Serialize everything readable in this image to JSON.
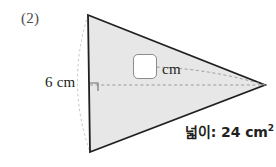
{
  "problem": {
    "item_number": "(2)",
    "height_label": "6 cm",
    "unit_label": "cm",
    "area_prefix": "넓이: 24 cm",
    "area_exponent": "2",
    "answer_value": ""
  },
  "figure": {
    "shape": "triangle",
    "fill_color": "#e7e7e7",
    "stroke_color": "#231f20",
    "guide_color": "#b9b9b9",
    "vertices": {
      "top": [
        88,
        15
      ],
      "bottom": [
        90,
        152
      ],
      "right": [
        265,
        85
      ]
    },
    "height_line": {
      "from": [
        90,
        85
      ],
      "to": [
        265,
        85
      ],
      "style": "dashed"
    },
    "right_angle_marker": {
      "x": 90,
      "y": 83,
      "size": 8
    },
    "base_arc": {
      "from": [
        88,
        15
      ],
      "to": [
        90,
        152
      ],
      "bulge_x": 66
    },
    "callout_line": {
      "from": [
        158,
        67
      ],
      "to": [
        265,
        85
      ],
      "style": "dashed"
    }
  },
  "colors": {
    "page_background": "#ffffff",
    "text": "#231f20",
    "label_gray": "#4a4a4a",
    "box_border": "#8c8c8c"
  }
}
